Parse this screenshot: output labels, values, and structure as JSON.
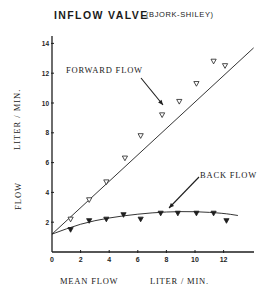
{
  "title": {
    "main": "INFLOW VALVE",
    "sub": "(BJORK-SHILEY)"
  },
  "axes": {
    "ylabel_top": "LITER / MIN.",
    "ylabel_bottom": "FLOW",
    "xlabel_left": "MEAN FLOW",
    "xlabel_right": "LITER / MIN.",
    "xticks": [
      "0",
      "2",
      "4",
      "6",
      "8",
      "10",
      "12"
    ],
    "yticks": [
      "2",
      "4",
      "6",
      "8",
      "10",
      "12",
      "14"
    ]
  },
  "annotations": {
    "forward": "FORWARD FLOW",
    "back": "BACK FLOW"
  },
  "chart_data": {
    "type": "scatter",
    "xlabel": "MEAN FLOW  LITER / MIN.",
    "ylabel": "FLOW  LITER / MIN.",
    "xlim": [
      0,
      14
    ],
    "ylim": [
      0,
      14.5
    ],
    "xticks": [
      0,
      2,
      4,
      6,
      8,
      10,
      12
    ],
    "yticks": [
      2,
      4,
      6,
      8,
      10,
      12,
      14
    ],
    "grid": false,
    "legend": "none (curves labeled by annotation arrows)",
    "series": [
      {
        "name": "FORWARD FLOW",
        "marker": "open triangle (down)",
        "fit": "linear",
        "fit_line": [
          [
            0,
            1.2
          ],
          [
            14.1,
            13.7
          ]
        ],
        "x": [
          1.3,
          2.6,
          3.8,
          5.1,
          6.2,
          7.7,
          8.9,
          10.1,
          11.3,
          12.1
        ],
        "y": [
          2.2,
          3.5,
          4.7,
          6.3,
          7.8,
          9.2,
          10.1,
          11.3,
          12.8,
          12.5
        ]
      },
      {
        "name": "BACK FLOW",
        "marker": "filled triangle (down)",
        "fit": "curved (saturating)",
        "fit_line": [
          [
            0,
            1.2
          ],
          [
            2,
            1.9
          ],
          [
            4,
            2.3
          ],
          [
            6,
            2.55
          ],
          [
            8,
            2.7
          ],
          [
            10,
            2.72
          ],
          [
            12,
            2.6
          ],
          [
            13,
            2.45
          ]
        ],
        "x": [
          1.3,
          2.6,
          3.8,
          5.0,
          6.2,
          7.6,
          8.8,
          10.1,
          11.3,
          12.2
        ],
        "y": [
          1.5,
          2.1,
          2.2,
          2.5,
          2.2,
          2.6,
          2.6,
          2.6,
          2.6,
          2.1
        ]
      }
    ]
  }
}
